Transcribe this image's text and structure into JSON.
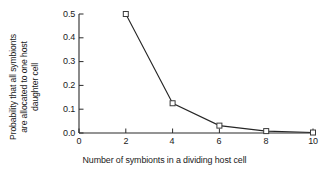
{
  "chart_data": {
    "type": "line",
    "title": "",
    "subtitle": "",
    "xlabel": "Number of symbionts in a dividing host cell",
    "ylabel_lines": [
      "Probability that all symbionts",
      "are allocated to one host",
      "daughter cell"
    ],
    "ylabel": "Probability that all symbionts are allocated to one host daughter cell",
    "x": [
      2,
      4,
      6,
      8,
      10
    ],
    "values": [
      0.5,
      0.125,
      0.031,
      0.008,
      0.002
    ],
    "series": [
      {
        "name": "Probability all symbionts to one daughter cell",
        "x": [
          2,
          4,
          6,
          8,
          10
        ],
        "values": [
          0.5,
          0.125,
          0.031,
          0.008,
          0.002
        ]
      }
    ],
    "xlim": [
      0,
      10
    ],
    "ylim": [
      0.0,
      0.5
    ],
    "xticks": [
      0,
      2,
      4,
      6,
      8,
      10
    ],
    "xtick_labels": [
      "0",
      "2",
      "4",
      "6",
      "8",
      "10"
    ],
    "yticks": [
      0.0,
      0.1,
      0.2,
      0.3,
      0.4,
      0.5
    ],
    "ytick_labels": [
      "0.0",
      "0.1",
      "0.2",
      "0.3",
      "0.4",
      "0.5"
    ],
    "grid": false,
    "legend": "none",
    "marker": "open-square",
    "line_color": "#262626",
    "marker_edge_color": "#3a3a3a",
    "marker_face_color": "#ffffff",
    "axis_color": "#2b2b2b",
    "background": "#ffffff"
  }
}
